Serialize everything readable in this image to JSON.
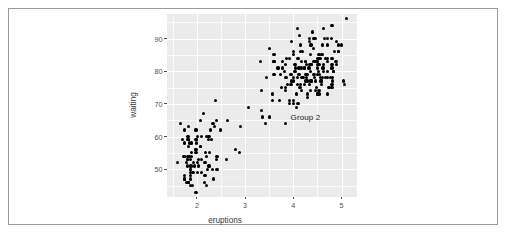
{
  "figure": {
    "background_color": "#ffffff",
    "frame_color": "#9a9a9a"
  },
  "panel": {
    "background_color": "#ebebeb",
    "gridline_color": "#ffffff"
  },
  "annotations": [
    {
      "name": "group-1-label",
      "text": "Group 1",
      "x": 2.75,
      "y": 47.6,
      "color": "#f1f1f1"
    },
    {
      "name": "group-2-label",
      "text": "Group 2",
      "x": 4.25,
      "y": 66.0,
      "color": "#1a1a1a"
    }
  ],
  "chart_data": {
    "type": "scatter",
    "title": "",
    "xlabel": "eruptions",
    "ylabel": "waiting",
    "xlim": [
      1.38,
      5.32
    ],
    "ylim": [
      41.5,
      97.5
    ],
    "xticks": [
      2,
      3,
      4,
      5
    ],
    "yticks": [
      50,
      60,
      70,
      80,
      90
    ],
    "xticks_minor": [
      1.5,
      2.5,
      3.5,
      4.5,
      5.0
    ],
    "yticks_minor": [
      45,
      55,
      65,
      75,
      85,
      95
    ],
    "grid": true,
    "legend": "none",
    "marker_color": "#000000",
    "marker_size": 3.2,
    "series": [
      {
        "name": "faithful",
        "x": [
          3.6,
          1.8,
          3.333,
          2.283,
          4.533,
          2.883,
          4.7,
          3.6,
          1.95,
          4.35,
          1.833,
          3.917,
          4.2,
          1.75,
          4.7,
          2.167,
          1.75,
          4.8,
          1.6,
          4.25,
          1.8,
          1.75,
          3.45,
          3.067,
          4.533,
          3.6,
          1.967,
          4.083,
          3.85,
          4.433,
          4.3,
          4.467,
          3.367,
          4.033,
          3.833,
          2.017,
          1.867,
          4.833,
          1.833,
          4.783,
          4.35,
          1.883,
          4.567,
          1.75,
          4.533,
          3.317,
          3.833,
          2.1,
          4.633,
          2.0,
          4.8,
          4.716,
          1.833,
          4.833,
          1.733,
          4.883,
          3.717,
          1.667,
          4.567,
          4.317,
          2.233,
          4.5,
          1.75,
          4.8,
          1.817,
          4.4,
          4.167,
          4.7,
          2.067,
          4.7,
          4.033,
          1.967,
          4.5,
          4.0,
          1.983,
          5.067,
          2.017,
          4.567,
          3.883,
          3.6,
          4.133,
          4.333,
          4.1,
          2.633,
          4.067,
          4.933,
          3.95,
          4.517,
          2.167,
          4.0,
          2.2,
          4.333,
          1.867,
          4.817,
          1.833,
          4.3,
          4.667,
          3.75,
          1.867,
          4.9,
          2.483,
          4.367,
          2.1,
          4.5,
          4.05,
          1.867,
          4.7,
          1.783,
          4.85,
          3.683,
          4.733,
          2.3,
          4.9,
          4.417,
          1.7,
          4.633,
          2.317,
          4.6,
          1.817,
          4.417,
          2.617,
          4.067,
          4.25,
          1.967,
          4.6,
          3.767,
          1.917,
          4.5,
          2.267,
          4.65,
          1.867,
          4.167,
          2.8,
          4.333,
          1.833,
          4.383,
          1.883,
          4.933,
          2.033,
          3.733,
          4.233,
          2.233,
          4.533,
          4.817,
          4.333,
          1.983,
          4.633,
          2.017,
          5.1,
          1.8,
          5.033,
          4.0,
          2.4,
          4.6,
          3.567,
          4.0,
          4.5,
          4.083,
          1.8,
          3.967,
          2.2,
          4.15,
          2.0,
          3.833,
          3.5,
          4.583,
          2.367,
          5.0,
          1.933,
          4.617,
          1.917,
          2.083,
          4.583,
          3.333,
          4.167,
          4.333,
          4.5,
          2.417,
          4.0,
          4.167,
          1.883,
          4.583,
          4.25,
          3.767,
          2.033,
          4.433,
          4.083,
          1.833,
          4.417,
          2.183,
          4.8,
          1.833,
          4.8,
          4.1,
          3.966,
          4.233,
          3.5,
          4.366,
          2.25,
          4.667,
          2.1,
          4.35,
          4.133,
          1.867,
          4.6,
          1.783,
          4.367,
          3.85,
          1.933,
          4.5,
          2.383,
          4.7,
          1.867,
          3.833,
          3.417,
          4.233,
          2.4,
          4.8,
          2.0,
          4.15,
          1.867,
          4.267,
          1.75,
          4.483,
          4.0,
          4.117,
          4.083,
          4.267,
          3.917,
          4.55,
          4.083,
          2.417,
          4.183,
          2.217,
          4.45,
          1.883,
          1.85,
          4.283,
          3.95,
          2.333,
          4.15,
          2.35,
          4.933,
          2.9,
          4.583,
          3.833,
          2.083,
          4.367,
          2.133,
          4.35,
          2.2,
          4.45,
          3.567,
          4.5,
          4.15,
          3.817,
          3.917,
          4.45,
          2.0,
          4.283,
          4.767,
          4.533,
          1.85,
          4.25,
          1.983,
          2.25,
          4.75,
          4.117,
          2.15,
          4.417,
          1.817,
          4.467
        ],
        "y": [
          79,
          54,
          74,
          62,
          85,
          55,
          88,
          85,
          51,
          85,
          54,
          84,
          78,
          47,
          83,
          52,
          62,
          84,
          52,
          79,
          51,
          47,
          78,
          69,
          74,
          83,
          55,
          76,
          78,
          79,
          73,
          77,
          66,
          80,
          74,
          52,
          48,
          80,
          59,
          90,
          80,
          58,
          84,
          58,
          73,
          83,
          64,
          53,
          82,
          59,
          75,
          90,
          54,
          80,
          54,
          83,
          71,
          64,
          77,
          81,
          59,
          84,
          48,
          82,
          60,
          92,
          78,
          78,
          65,
          73,
          82,
          56,
          79,
          71,
          62,
          76,
          60,
          78,
          76,
          83,
          75,
          82,
          70,
          65,
          73,
          88,
          76,
          80,
          48,
          86,
          60,
          90,
          50,
          78,
          63,
          72,
          84,
          75,
          51,
          82,
          62,
          88,
          49,
          83,
          81,
          47,
          84,
          52,
          86,
          81,
          75,
          59,
          89,
          79,
          59,
          81,
          50,
          85,
          59,
          87,
          53,
          69,
          77,
          56,
          88,
          81,
          45,
          82,
          55,
          90,
          45,
          83,
          56,
          89,
          46,
          82,
          51,
          86,
          53,
          79,
          81,
          60,
          82,
          77,
          76,
          59,
          80,
          49,
          96,
          53,
          77,
          77,
          65,
          81,
          71,
          70,
          81,
          93,
          53,
          89,
          45,
          86,
          58,
          78,
          66,
          76,
          63,
          88,
          52,
          93,
          49,
          57,
          77,
          68,
          81,
          81,
          73,
          50,
          85,
          74,
          55,
          77,
          83,
          83,
          51,
          78,
          84,
          46,
          83,
          55,
          81,
          57,
          76,
          84,
          77,
          81,
          87,
          77,
          51,
          78,
          60,
          82,
          91,
          53,
          78,
          46,
          77,
          84,
          49,
          83,
          71,
          80,
          49,
          75,
          64,
          76,
          53,
          94,
          55,
          76,
          50,
          82,
          54,
          75,
          78,
          79,
          78,
          78,
          70,
          79,
          70,
          54,
          86,
          50,
          90,
          54,
          54,
          77,
          79,
          64,
          75,
          47,
          86,
          63,
          85,
          82,
          57,
          82,
          67,
          74,
          54,
          83,
          73,
          73,
          88,
          80,
          71,
          83,
          56,
          79,
          78,
          84,
          58,
          83,
          43,
          60,
          75,
          81,
          46,
          90,
          46,
          74
        ]
      }
    ]
  }
}
